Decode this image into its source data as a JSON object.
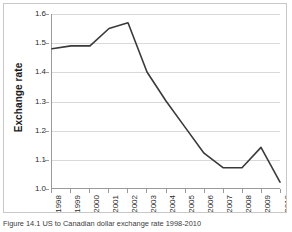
{
  "figure": {
    "caption": "Figure 14.1 US to Canadian dollar exchange rate 1998-2010"
  },
  "colors": {
    "line": "#3a3a3a",
    "gridline": "#d9d9d9",
    "axis": "#9a9a9a",
    "frame": "#c8c8c8",
    "background": "#ffffff",
    "text": "#2b2b2b"
  },
  "chart_data": {
    "type": "line",
    "title": "",
    "xlabel": "",
    "ylabel": "Exchange rate",
    "x": [
      1998,
      1999,
      2000,
      2001,
      2002,
      2003,
      2004,
      2005,
      2006,
      2007,
      2008,
      2009,
      2010
    ],
    "categories": [
      "1998",
      "1999",
      "2000",
      "2001",
      "2002",
      "2003",
      "2004",
      "2005",
      "2006",
      "2007",
      "2008",
      "2009",
      "2010"
    ],
    "values": [
      1.48,
      1.49,
      1.49,
      1.55,
      1.57,
      1.4,
      1.3,
      1.21,
      1.12,
      1.07,
      1.07,
      1.14,
      1.02
    ],
    "series": [
      {
        "name": "Exchange rate",
        "values": [
          1.48,
          1.49,
          1.49,
          1.55,
          1.57,
          1.4,
          1.3,
          1.21,
          1.12,
          1.07,
          1.07,
          1.14,
          1.02
        ]
      }
    ],
    "ylim": [
      1.0,
      1.6
    ],
    "ytick_step": 0.1,
    "yticks": [
      "1.6",
      "1.5",
      "1.4",
      "1.3",
      "1.2",
      "1.1",
      "1.0"
    ],
    "ytick_values": [
      1.6,
      1.5,
      1.4,
      1.3,
      1.2,
      1.1,
      1.0
    ],
    "grid": true,
    "grid_axis": "y",
    "legend": false,
    "legend_position": "none",
    "xtick_rotation": -90
  }
}
